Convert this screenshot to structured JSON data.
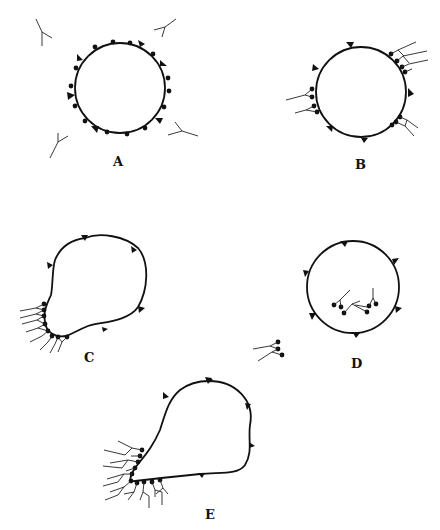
{
  "figure": {
    "panels": [
      {
        "id": "A",
        "label": "A",
        "shape": "circle",
        "description": "Cell with surface receptors (dots) and markers (triangles); free Y-shaped antibodies around"
      },
      {
        "id": "B",
        "label": "B",
        "shape": "circle",
        "description": "Antibodies bound to receptors forming small patches"
      },
      {
        "id": "C",
        "label": "C",
        "shape": "bulged cell",
        "description": "Receptor-antibody complexes aggregated into a cap on one side"
      },
      {
        "id": "D",
        "label": "D",
        "shape": "circle",
        "description": "Complexes internalized; some shed outside"
      },
      {
        "id": "E",
        "label": "E",
        "shape": "teardrop",
        "description": "Large cap of receptor-antibody complexes at the tail"
      }
    ]
  },
  "colors": {
    "ink": "#111111",
    "background": "#ffffff"
  }
}
